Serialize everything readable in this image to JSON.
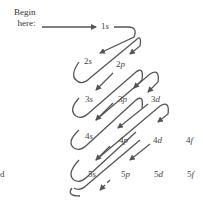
{
  "begin_label_line1": "Begin",
  "begin_label_line2": "here:",
  "orbitals": [
    {
      "id": "1s",
      "n": "1",
      "l": "s",
      "x": 103,
      "y": 23
    },
    {
      "id": "2s",
      "n": "2",
      "l": "s",
      "x": 86,
      "y": 67
    },
    {
      "id": "2p",
      "n": "2",
      "l": "p",
      "x": 117,
      "y": 67
    },
    {
      "id": "3s",
      "n": "3",
      "l": "s",
      "x": 86,
      "y": 98
    },
    {
      "id": "3p",
      "n": "3",
      "l": "p",
      "x": 117,
      "y": 98
    },
    {
      "id": "3d",
      "n": "3",
      "l": "d",
      "x": 152,
      "y": 98
    },
    {
      "id": "4s",
      "n": "4",
      "l": "s",
      "x": 86,
      "y": 130
    },
    {
      "id": "4p",
      "n": "4",
      "l": "p",
      "x": 120,
      "y": 138
    },
    {
      "id": "4d",
      "n": "4",
      "l": "d",
      "x": 152,
      "y": 138
    },
    {
      "id": "4f",
      "n": "4",
      "l": "f",
      "x": 187,
      "y": 138
    },
    {
      "id": "5s",
      "n": "5",
      "l": "s",
      "x": 88,
      "y": 168
    },
    {
      "id": "5p",
      "n": "5",
      "l": "p",
      "x": 120,
      "y": 168
    },
    {
      "id": "5d",
      "n": "5",
      "l": "d",
      "x": 154,
      "y": 168
    },
    {
      "id": "5f",
      "n": "5",
      "l": "f",
      "x": 187,
      "y": 168
    }
  ],
  "stray_text": "d",
  "colors": {
    "arrow": "#555555",
    "text": "#444444"
  }
}
